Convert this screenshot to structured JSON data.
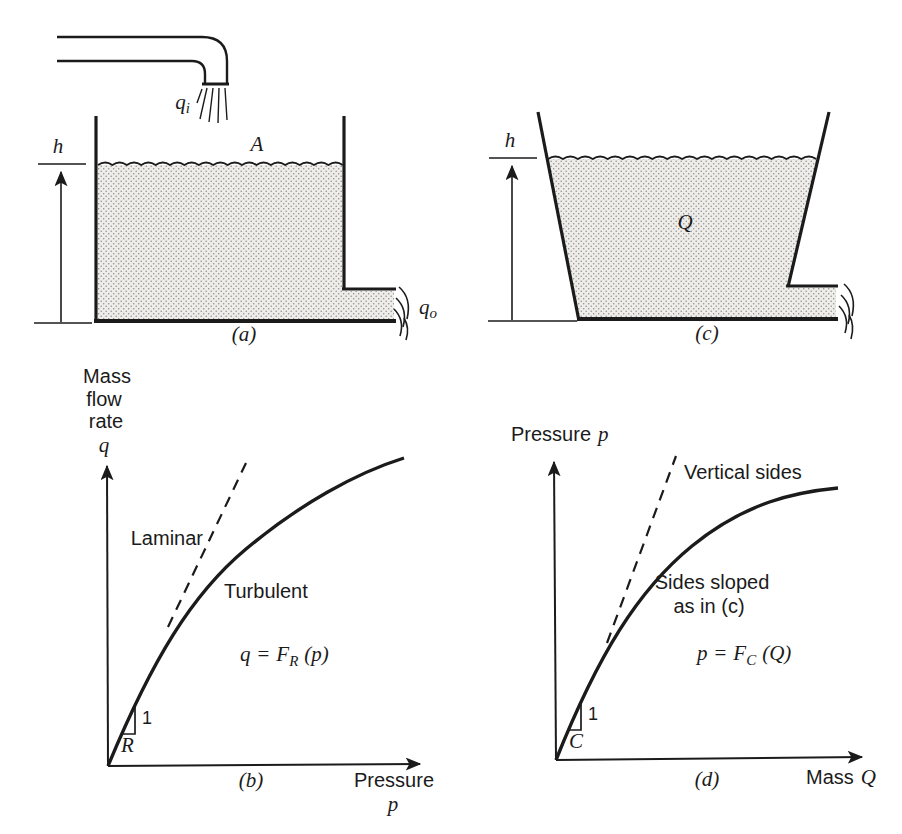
{
  "panel_a": {
    "caption": "(a)",
    "height_label": "h",
    "area_label": "A",
    "inflow": {
      "symbol": "q",
      "sub": "i"
    },
    "outflow": {
      "symbol": "q",
      "sub": "o"
    }
  },
  "panel_b": {
    "caption": "(b)",
    "y_axis": {
      "lines": [
        "Mass",
        "flow",
        "rate"
      ],
      "symbol": "q"
    },
    "x_axis": {
      "label": "Pressure",
      "symbol": "p"
    },
    "dashed_label": "Laminar",
    "solid_label": "Turbulent",
    "equation": {
      "lhs": "q",
      "rel": "=",
      "fn": "F",
      "sub": "R",
      "arg": "(p)"
    },
    "slope_triangle": {
      "rise": "1",
      "slope": "R"
    }
  },
  "panel_c": {
    "caption": "(c)",
    "height_label": "h",
    "volume_label": "Q"
  },
  "panel_d": {
    "caption": "(d)",
    "y_axis": {
      "label": "Pressure",
      "symbol": "p"
    },
    "x_axis": {
      "label": "Mass",
      "symbol": "Q"
    },
    "dashed_label": "Vertical sides",
    "solid_label_line1": "Sides sloped",
    "solid_label_line2": "as in (c)",
    "equation": {
      "lhs": "p",
      "rel": "=",
      "fn": "F",
      "sub": "C",
      "arg": "(Q)"
    },
    "slope_triangle": {
      "rise": "1",
      "slope": "C"
    }
  },
  "colors": {
    "ink": "#1b1b1b",
    "paper": "#ffffff",
    "water_dot": "#8c8c8c",
    "water_bg": "#efedea"
  }
}
